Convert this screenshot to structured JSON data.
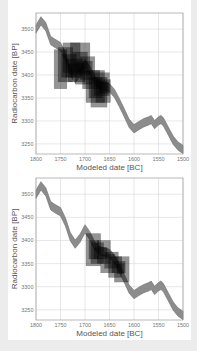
{
  "colors": {
    "background": "#ececec",
    "panel": "#ffffff",
    "grid": "#d6d6d6",
    "frame": "#9a9a9a",
    "curve_fill": "#8c8c8c",
    "curve_stroke": "#6e6e6e",
    "box_fill": "#000000",
    "box_opacity": 0.42
  },
  "chart_data": [
    {
      "type": "area",
      "panel": "top",
      "title": "",
      "xlabel": "Modeled date [BC]",
      "ylabel": "Radiocarbon date [BP]",
      "xlim": [
        1800,
        1500
      ],
      "ylim": [
        3228,
        3535
      ],
      "x_ticks": [
        1800,
        1750,
        1700,
        1650,
        1600,
        1550,
        1500
      ],
      "y_ticks": [
        3500,
        3450,
        3400,
        3350,
        3300,
        3250
      ],
      "grid": true,
      "calibration_curve": {
        "x": [
          1800,
          1790,
          1780,
          1770,
          1760,
          1750,
          1740,
          1730,
          1720,
          1710,
          1700,
          1690,
          1680,
          1670,
          1660,
          1650,
          1640,
          1630,
          1620,
          1610,
          1600,
          1590,
          1580,
          1570,
          1565,
          1558,
          1550,
          1545,
          1540,
          1530,
          1520,
          1510,
          1500
        ],
        "center": [
          3500,
          3518,
          3505,
          3475,
          3468,
          3462,
          3440,
          3408,
          3392,
          3405,
          3425,
          3410,
          3388,
          3378,
          3375,
          3372,
          3360,
          3340,
          3318,
          3295,
          3283,
          3290,
          3296,
          3300,
          3303,
          3292,
          3300,
          3303,
          3298,
          3278,
          3258,
          3245,
          3238
        ],
        "half_width": 9
      },
      "boxes": [
        {
          "x0": 1763,
          "x1": 1737,
          "y0": 3370,
          "y1": 3455
        },
        {
          "x0": 1755,
          "x1": 1725,
          "y0": 3385,
          "y1": 3460
        },
        {
          "x0": 1748,
          "x1": 1718,
          "y0": 3395,
          "y1": 3445
        },
        {
          "x0": 1745,
          "x1": 1710,
          "y0": 3405,
          "y1": 3470
        },
        {
          "x0": 1740,
          "x1": 1705,
          "y0": 3395,
          "y1": 3435
        },
        {
          "x0": 1735,
          "x1": 1700,
          "y0": 3385,
          "y1": 3425
        },
        {
          "x0": 1730,
          "x1": 1690,
          "y0": 3400,
          "y1": 3470
        },
        {
          "x0": 1725,
          "x1": 1695,
          "y0": 3405,
          "y1": 3450
        },
        {
          "x0": 1720,
          "x1": 1685,
          "y0": 3380,
          "y1": 3430
        },
        {
          "x0": 1710,
          "x1": 1680,
          "y0": 3390,
          "y1": 3440
        },
        {
          "x0": 1705,
          "x1": 1670,
          "y0": 3370,
          "y1": 3410
        },
        {
          "x0": 1698,
          "x1": 1660,
          "y0": 3340,
          "y1": 3410
        },
        {
          "x0": 1692,
          "x1": 1665,
          "y0": 3350,
          "y1": 3395
        },
        {
          "x0": 1688,
          "x1": 1655,
          "y0": 3330,
          "y1": 3395
        },
        {
          "x0": 1682,
          "x1": 1650,
          "y0": 3355,
          "y1": 3405
        },
        {
          "x0": 1678,
          "x1": 1648,
          "y0": 3340,
          "y1": 3390
        },
        {
          "x0": 1672,
          "x1": 1652,
          "y0": 3360,
          "y1": 3385
        }
      ]
    },
    {
      "type": "area",
      "panel": "bottom",
      "title": "",
      "xlabel": "Modeled date [BC]",
      "ylabel": "Radiocarbon date [BP]",
      "xlim": [
        1800,
        1500
      ],
      "ylim": [
        3228,
        3535
      ],
      "x_ticks": [
        1800,
        1750,
        1700,
        1650,
        1600,
        1550,
        1500
      ],
      "y_ticks": [
        3500,
        3450,
        3400,
        3350,
        3300,
        3250
      ],
      "grid": true,
      "calibration_curve": {
        "x": [
          1800,
          1790,
          1780,
          1770,
          1760,
          1750,
          1740,
          1730,
          1720,
          1710,
          1700,
          1690,
          1680,
          1670,
          1660,
          1650,
          1640,
          1630,
          1620,
          1610,
          1600,
          1590,
          1580,
          1570,
          1565,
          1558,
          1550,
          1545,
          1540,
          1530,
          1520,
          1510,
          1500
        ],
        "center": [
          3500,
          3518,
          3505,
          3475,
          3468,
          3462,
          3440,
          3408,
          3392,
          3405,
          3425,
          3410,
          3388,
          3378,
          3375,
          3372,
          3360,
          3340,
          3318,
          3295,
          3283,
          3290,
          3296,
          3300,
          3303,
          3292,
          3300,
          3303,
          3298,
          3278,
          3258,
          3245,
          3238
        ],
        "half_width": 9
      },
      "boxes": [
        {
          "x0": 1698,
          "x1": 1668,
          "y0": 3345,
          "y1": 3415
        },
        {
          "x0": 1692,
          "x1": 1672,
          "y0": 3360,
          "y1": 3400
        },
        {
          "x0": 1688,
          "x1": 1662,
          "y0": 3350,
          "y1": 3395
        },
        {
          "x0": 1682,
          "x1": 1655,
          "y0": 3360,
          "y1": 3385
        },
        {
          "x0": 1675,
          "x1": 1648,
          "y0": 3350,
          "y1": 3400
        },
        {
          "x0": 1668,
          "x1": 1640,
          "y0": 3330,
          "y1": 3370
        },
        {
          "x0": 1660,
          "x1": 1632,
          "y0": 3340,
          "y1": 3375
        },
        {
          "x0": 1652,
          "x1": 1625,
          "y0": 3320,
          "y1": 3365
        },
        {
          "x0": 1645,
          "x1": 1618,
          "y0": 3330,
          "y1": 3355
        },
        {
          "x0": 1640,
          "x1": 1610,
          "y0": 3310,
          "y1": 3365
        },
        {
          "x0": 1635,
          "x1": 1620,
          "y0": 3328,
          "y1": 3350
        }
      ]
    }
  ],
  "panels": {
    "top": {
      "ylabel": "Radiocarbon date [BP]",
      "xlabel": "Modeled date [BC]"
    },
    "bottom": {
      "ylabel": "Radiocarbon date [BP]",
      "xlabel": "Modeled date [BC]"
    }
  }
}
